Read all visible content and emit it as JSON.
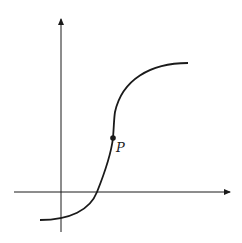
{
  "diagram": {
    "type": "function-graph",
    "point_label": "P",
    "colors": {
      "stroke": "#1a1a1a",
      "background": "#ffffff"
    }
  }
}
